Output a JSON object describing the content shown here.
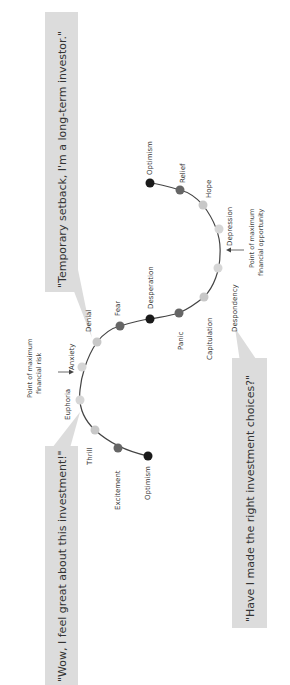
{
  "quotes": {
    "top": "\"Temporary setback, I'm a long-term investor.\"",
    "left": "\"Wow, I feel great about this investment!\"",
    "right": "\"Have I made the right investment choices?\""
  },
  "annotations": {
    "risk_line1": "Point of maximum",
    "risk_line2": "financial risk",
    "opp_line1": "Point of maximum",
    "opp_line2": "financial opportunity"
  },
  "stages": [
    {
      "label": "Optimism",
      "color": "#1a1a1a"
    },
    {
      "label": "Excitement",
      "color": "#666666"
    },
    {
      "label": "Thrill",
      "color": "#c8c8c8"
    },
    {
      "label": "Euphoria",
      "color": "#d6d6d6"
    },
    {
      "label": "Anxiety",
      "color": "#d6d6d6"
    },
    {
      "label": "Denial",
      "color": "#c8c8c8"
    },
    {
      "label": "Fear",
      "color": "#666666"
    },
    {
      "label": "Desperation",
      "color": "#1a1a1a"
    },
    {
      "label": "Panic",
      "color": "#666666"
    },
    {
      "label": "Capitulation",
      "color": "#c8c8c8"
    },
    {
      "label": "Despondency",
      "color": "#d6d6d6"
    },
    {
      "label": "Depression",
      "color": "#d6d6d6"
    },
    {
      "label": "Hope",
      "color": "#c8c8c8"
    },
    {
      "label": "Relief",
      "color": "#666666"
    },
    {
      "label": "Optimism",
      "color": "#1a1a1a"
    }
  ],
  "colors": {
    "callout_bg": "#dcdcdc",
    "curve": "#444444"
  }
}
